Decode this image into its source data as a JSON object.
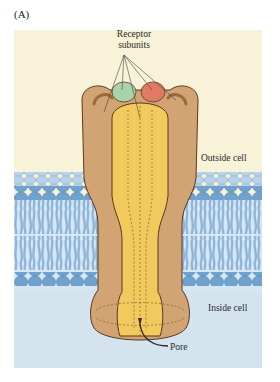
{
  "figure": {
    "panel_label": "(A)",
    "labels": {
      "receptor_subunits_line1": "Receptor",
      "receptor_subunits_line2": "subunits",
      "outside_cell": "Outside cell",
      "inside_cell": "Inside cell",
      "pore": "Pore"
    },
    "colors": {
      "outside_bg": "#f8f2d8",
      "inside_bg": "#d3e4ef",
      "membrane_head": "#6fa2cf",
      "membrane_tail": "#a9c8e3",
      "receptor_outer": "#d2a373",
      "receptor_inner": "#f2c95c",
      "subunit_green": "#a9d3a8",
      "subunit_red": "#e07a62"
    }
  }
}
